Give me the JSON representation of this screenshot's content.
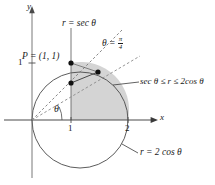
{
  "figure": {
    "name": "polar-region-diagram",
    "width": 215,
    "height": 185,
    "background": "#ffffff",
    "colors": {
      "stroke": "#3a3a3a",
      "axis": "#5a5a5a",
      "text": "#1a1a1a",
      "shade_fill": "#d4d4d4",
      "dot": "#111111"
    }
  },
  "axes": {
    "x_label": "x",
    "y_label": "y",
    "origin": {
      "x": 32,
      "y": 120
    },
    "x_ticks": [
      {
        "label": "1",
        "x": 71
      },
      {
        "label": "2",
        "x": 128
      }
    ],
    "y_ticks": [
      {
        "label": "1",
        "y": 63
      }
    ]
  },
  "curves": {
    "circle_label": "r = 2 cos θ",
    "circle": {
      "cx": 80,
      "cy": 120,
      "r": 48
    },
    "secant_line_label": "r = sec θ",
    "secant_line_x": 71,
    "ray_label_prefix": "θ = ",
    "ray_label_num": "π",
    "ray_label_den": "4",
    "angle_label": "θ"
  },
  "annotations": {
    "point_label": "P = (1, 1)",
    "inequality": "sec θ ≤ r ≤ 2cos θ"
  },
  "points": [
    {
      "name": "point-P",
      "x": 71,
      "y": 63
    },
    {
      "name": "point-inner",
      "x": 71,
      "y": 83
    },
    {
      "name": "point-on-circle",
      "x": 98,
      "y": 72
    }
  ]
}
